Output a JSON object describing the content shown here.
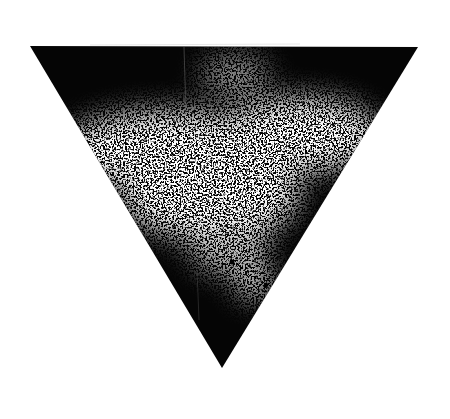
{
  "image": {
    "subject": "ink print of a downward-pointing triangle",
    "description": "Black inverted triangle with a mottled white speckled band across the middle and a dark lower tip",
    "colors": {
      "background": "#ffffff",
      "ink": "#000000",
      "speckle": "#ffffff"
    }
  }
}
